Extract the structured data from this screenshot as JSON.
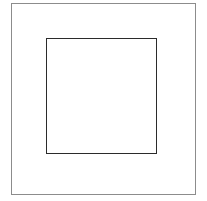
{
  "figure": {
    "canvas": {
      "width": 207,
      "height": 201,
      "background_color": "#ffffff"
    },
    "shapes": [
      {
        "name": "outer-square",
        "type": "square",
        "x": 11,
        "y": 3,
        "width": 185,
        "height": 192,
        "stroke_color": "#8c8c8c",
        "stroke_width": 1,
        "fill": "none"
      },
      {
        "name": "inner-square",
        "type": "square",
        "x": 46,
        "y": 38,
        "width": 111,
        "height": 116,
        "stroke_color": "#2b2b2b",
        "stroke_width": 1.6,
        "fill": "none"
      }
    ],
    "labels": []
  }
}
